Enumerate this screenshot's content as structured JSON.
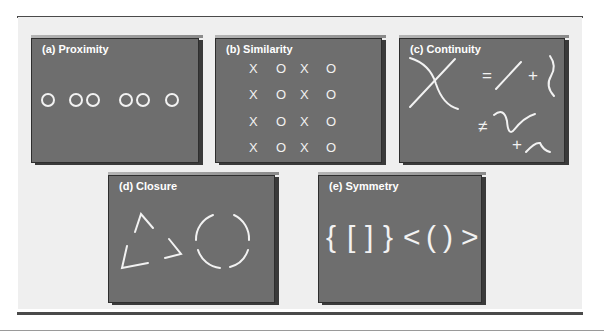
{
  "figure": {
    "panels": [
      {
        "id": "a",
        "title": "(a) Proximity",
        "principle": "proximity",
        "content": "circles grouped: O  OO  OO  O",
        "groups": [
          1,
          2,
          2,
          1
        ]
      },
      {
        "id": "b",
        "title": "(b) Similarity",
        "principle": "similarity",
        "grid": [
          [
            "X",
            "O",
            "X",
            "O"
          ],
          [
            "X",
            "O",
            "X",
            "O"
          ],
          [
            "X",
            "O",
            "X",
            "O"
          ],
          [
            "X",
            "O",
            "X",
            "O"
          ]
        ]
      },
      {
        "id": "c",
        "title": "(c) Continuity",
        "principle": "continuity",
        "symbols": {
          "equals": "=",
          "plus": "+",
          "not_equals": "≠"
        }
      },
      {
        "id": "d",
        "title": "(d) Closure",
        "principle": "closure",
        "shapes": [
          "broken-triangle",
          "broken-circle"
        ]
      },
      {
        "id": "e",
        "title": "(e) Symmetry",
        "principle": "symmetry",
        "symbols": [
          "{",
          "[",
          "]",
          "}",
          "<",
          "(",
          ")",
          ">"
        ]
      }
    ]
  },
  "colors": {
    "panel_fill": "#6e6e6e",
    "panel_border": "#2e2e2e",
    "figure_background": "#efefef",
    "stroke": "#f2f2f2",
    "rule": "#4a4a4a"
  }
}
